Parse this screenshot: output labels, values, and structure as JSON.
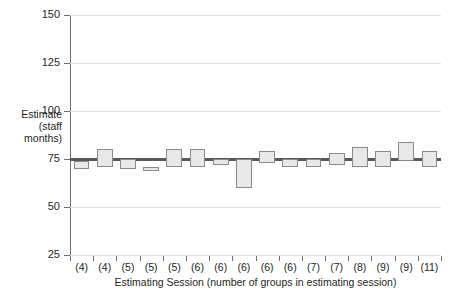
{
  "chart_data": {
    "type": "box",
    "title": "",
    "xlabel": "Estimating Session (number of groups in estimating session)",
    "ylabel": "Estimate\n(staff\nmonths)",
    "ylim": [
      25,
      150
    ],
    "yticks": [
      25,
      50,
      75,
      100,
      125,
      150
    ],
    "ytick_labels": [
      "25",
      "50",
      "75",
      "100",
      "125",
      "150"
    ],
    "grid": true,
    "legend": "none",
    "reference_line": 75,
    "categories": [
      "(4)",
      "(4)",
      "(5)",
      "(5)",
      "(5)",
      "(6)",
      "(6)",
      "(6)",
      "(6)",
      "(6)",
      "(7)",
      "(7)",
      "(8)",
      "(9)",
      "(9)",
      "(11)"
    ],
    "group_counts": [
      4,
      4,
      5,
      5,
      5,
      6,
      6,
      6,
      6,
      6,
      7,
      7,
      8,
      9,
      9,
      11
    ],
    "boxes": [
      {
        "session": 1,
        "label": "(4)",
        "low": 70,
        "high": 74
      },
      {
        "session": 2,
        "label": "(4)",
        "low": 71,
        "high": 80
      },
      {
        "session": 3,
        "label": "(5)",
        "low": 70,
        "high": 75
      },
      {
        "session": 4,
        "label": "(5)",
        "low": 70,
        "high": 71
      },
      {
        "session": 5,
        "label": "(5)",
        "low": 71,
        "high": 80
      },
      {
        "session": 6,
        "label": "(6)",
        "low": 71,
        "high": 80
      },
      {
        "session": 7,
        "label": "(6)",
        "low": 72,
        "high": 75
      },
      {
        "session": 8,
        "label": "(6)",
        "low": 60,
        "high": 75
      },
      {
        "session": 9,
        "label": "(6)",
        "low": 73,
        "high": 79
      },
      {
        "session": 10,
        "label": "(6)",
        "low": 71,
        "high": 75
      },
      {
        "session": 11,
        "label": "(7)",
        "low": 71,
        "high": 75
      },
      {
        "session": 12,
        "label": "(7)",
        "low": 72,
        "high": 78
      },
      {
        "session": 13,
        "label": "(8)",
        "low": 71,
        "high": 81
      },
      {
        "session": 14,
        "label": "(9)",
        "low": 71,
        "high": 79
      },
      {
        "session": 15,
        "label": "(9)",
        "low": 74,
        "high": 84
      },
      {
        "session": 16,
        "label": "(11)",
        "low": 71,
        "high": 79
      }
    ],
    "colors": {
      "box_fill": "#e8e8e8",
      "box_stroke": "#8a8a8a",
      "axis": "#6e6e6e",
      "grid": "#e3e3e3",
      "reference_line": "#595959",
      "text": "#231f20"
    }
  }
}
